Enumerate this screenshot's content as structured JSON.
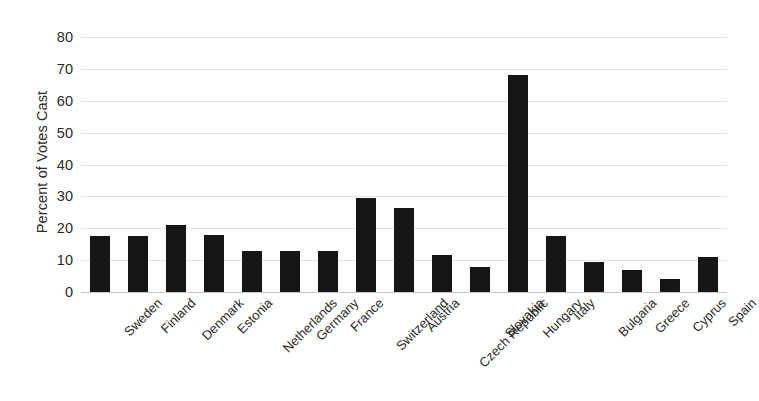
{
  "chart_data": {
    "type": "bar",
    "title": "",
    "subtitle": "",
    "xlabel": "",
    "ylabel": "Percent of Votes Cast",
    "ylim": [
      0,
      80
    ],
    "yticks": [
      0,
      10,
      20,
      30,
      40,
      50,
      60,
      70,
      80
    ],
    "ytick_labels": [
      "0",
      "10",
      "20",
      "30",
      "40",
      "50",
      "60",
      "70",
      "80"
    ],
    "grid": "horizontal",
    "legend": "none",
    "orientation": "vertical",
    "bar_color": "#161616",
    "gridline_color": "#e3e3e3",
    "background_color": "#ffffff",
    "categories": [
      "Sweden",
      "Finland",
      "Denmark",
      "Estonia",
      "Netherlands",
      "Germany",
      "France",
      "Switzerland",
      "Austria",
      "Czech Republic",
      "Slovakia",
      "Hungary",
      "Italy",
      "Bulgaria",
      "Greece",
      "Cyprus",
      "Spain"
    ],
    "values": [
      17.5,
      17.5,
      21,
      17.8,
      13,
      12.8,
      13,
      29.5,
      26.5,
      11.5,
      8,
      68,
      17.5,
      9.5,
      7,
      4,
      11
    ],
    "annotations": []
  }
}
